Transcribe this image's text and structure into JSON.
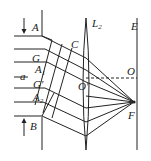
{
  "diagram": {
    "type": "optics-lens-focusing",
    "labels": {
      "A": "A",
      "B": "B",
      "C": "C",
      "G": "G",
      "G_prime": "G′",
      "A1": "A",
      "A1_sub": "1",
      "A2": "A",
      "A2_sub": "2",
      "a": "a",
      "L2": "L",
      "L2_sub": "2",
      "E": "E",
      "O": "O",
      "O_prime": "O′",
      "F": "F"
    },
    "colors": {
      "line": "#222222",
      "background": "#ffffff"
    }
  }
}
